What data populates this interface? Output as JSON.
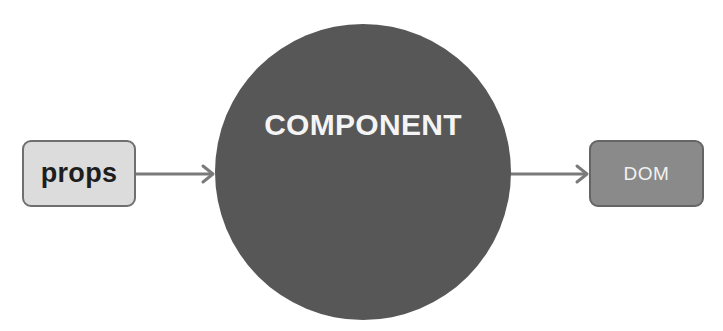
{
  "diagram": {
    "type": "flow",
    "nodes": {
      "props": {
        "label": "props",
        "fill": "#dcdcdc",
        "text_color": "#1e1e1e"
      },
      "component": {
        "label": "COMPONENT",
        "fill": "#575757",
        "text_color": "#f4f4f4"
      },
      "dom": {
        "label": "DOM",
        "fill": "#8a8a8a",
        "text_color": "#f2f2f2"
      }
    },
    "edges": [
      {
        "from": "props",
        "to": "component"
      },
      {
        "from": "component",
        "to": "dom"
      }
    ],
    "arrow_color": "#7a7a7a"
  }
}
